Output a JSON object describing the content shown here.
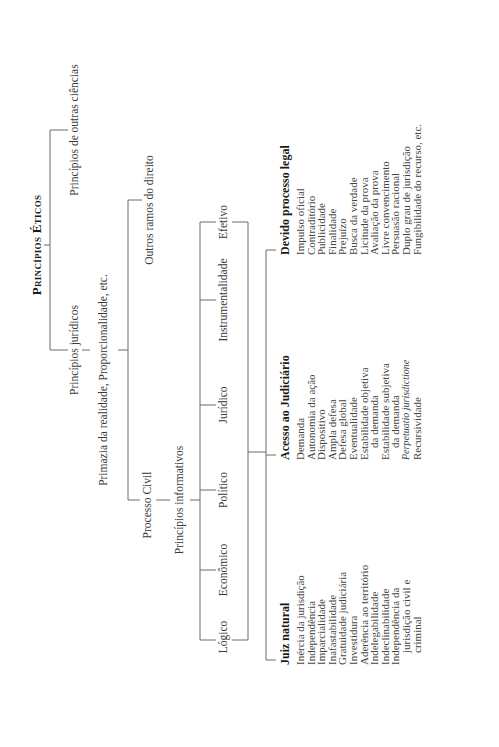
{
  "diagram": {
    "root": "Princípios Éticos",
    "level1": [
      "Princípios jurídicos",
      "Princípios de outras ciências"
    ],
    "level2": [
      "Primazia da realidade, Proporcionalidade, etc.",
      "Outros ramos do direito"
    ],
    "level3": {
      "processo_civil": "Processo Civil",
      "informativos": "Princípios informativos"
    },
    "informativos_items": [
      "Lógico",
      "Econômico",
      "Político",
      "Jurídico",
      "Instrumentalidade",
      "Efetivo"
    ],
    "columns": [
      {
        "header": "Juiz natural",
        "items": [
          {
            "text": "Inércia da jurisdição"
          },
          {
            "text": "Independência"
          },
          {
            "text": "Imparcialidade"
          },
          {
            "text": "Inafastabilidade"
          },
          {
            "text": "Gratuidade judiciária"
          },
          {
            "text": "Investidura"
          },
          {
            "text": "Aderência ao território"
          },
          {
            "text": "Indelegabilidade"
          },
          {
            "text": "Indeclinabilidade"
          },
          {
            "text": "Independência da"
          },
          {
            "text": "jurisdição civil e",
            "indent": true
          },
          {
            "text": "criminal",
            "indent": true
          }
        ]
      },
      {
        "header": "Acesso ao Judiciário",
        "items": [
          {
            "text": "Demanda"
          },
          {
            "text": "Autonomia da ação"
          },
          {
            "text": "Dispositivo"
          },
          {
            "text": "Ampla defesa"
          },
          {
            "text": "Defesa global"
          },
          {
            "text": "Eventualidade"
          },
          {
            "text": "Estabilidade objetiva"
          },
          {
            "text": "da demanda",
            "indent": true
          },
          {
            "text": "Estabilidade subjetiva"
          },
          {
            "text": "da demanda",
            "indent": true
          },
          {
            "text": "Perpetuatio jurisdictione",
            "italic": true
          },
          {
            "text": "Recursividade"
          }
        ]
      },
      {
        "header": "Devido processo legal",
        "items": [
          {
            "text": "Impulso oficial"
          },
          {
            "text": "Contraditório"
          },
          {
            "text": "Publicidade"
          },
          {
            "text": "Finalidade"
          },
          {
            "text": "Prejuízo"
          },
          {
            "text": "Busca da verdade"
          },
          {
            "text": "Licitude da prova"
          },
          {
            "text": "Avaliação da prova"
          },
          {
            "text": "Livre convencimento"
          },
          {
            "text": "Persuasão racional"
          },
          {
            "text": "Duplo grau de jurisdição"
          },
          {
            "text": "Fungibilidade do recurso, etc."
          }
        ]
      }
    ]
  }
}
